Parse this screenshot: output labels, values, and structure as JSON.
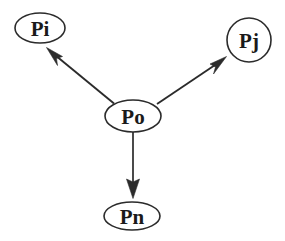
{
  "diagram": {
    "background_color": "#ffffff",
    "stroke_color": "#2b2b2b",
    "label_color": "#1a1a1a",
    "nodes": [
      {
        "id": "pi",
        "label": "Pi",
        "shape": "ellipse",
        "cx": 40,
        "cy": 28,
        "rx": 25,
        "ry": 15
      },
      {
        "id": "pj",
        "label": "Pj",
        "shape": "circle",
        "cx": 249,
        "cy": 40,
        "rx": 22,
        "ry": 22
      },
      {
        "id": "po",
        "label": "Po",
        "shape": "ellipse",
        "cx": 133,
        "cy": 116,
        "rx": 28,
        "ry": 16
      },
      {
        "id": "pn",
        "label": "Pn",
        "shape": "ellipse",
        "cx": 132,
        "cy": 216,
        "rx": 28,
        "ry": 14
      }
    ],
    "edges": [
      {
        "id": "po-to-pi",
        "from": "po",
        "to": "pi",
        "direction": "up-left",
        "arrow": "solid-triangle",
        "x1": 115,
        "y1": 104,
        "x2": 49,
        "y2": 50
      },
      {
        "id": "po-to-pj",
        "from": "po",
        "to": "pj",
        "direction": "up-right",
        "arrow": "solid-triangle",
        "x1": 156,
        "y1": 104,
        "x2": 226,
        "y2": 58
      },
      {
        "id": "po-to-pn",
        "from": "po",
        "to": "pn",
        "direction": "down",
        "arrow": "solid-triangle",
        "x1": 133,
        "y1": 132,
        "x2": 133,
        "y2": 199
      }
    ]
  }
}
